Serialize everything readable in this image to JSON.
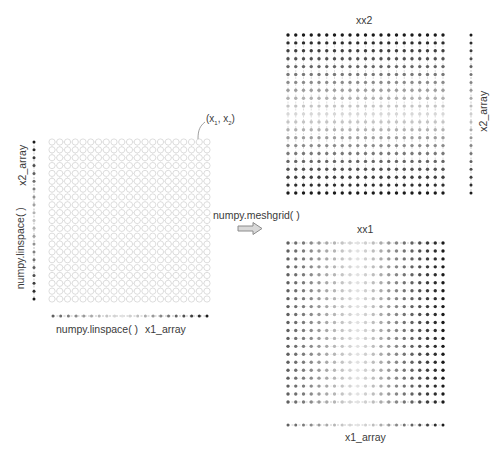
{
  "left_panel": {
    "point_label": "(x₁, x₂)",
    "point_label_main": "(x",
    "x_axis_labels": [
      "numpy.linspace( )",
      "x1_array"
    ],
    "y_axis_labels": [
      "x2_array",
      "numpy.linspace( )"
    ],
    "grid": {
      "cols": 21,
      "rows": 21,
      "x0": 52,
      "y0": 142,
      "x1": 207,
      "y1": 299
    },
    "x_axis": {
      "y": 316,
      "x0": 53,
      "x1": 207,
      "n": 21
    },
    "y_axis": {
      "x": 34,
      "y0": 142,
      "y1": 299,
      "n": 21
    }
  },
  "operation": {
    "label": "numpy.meshgrid( )",
    "arrow_color": "#8c8c8c"
  },
  "xx2_panel": {
    "title": "xx2",
    "side_label": "x2_array",
    "grid": {
      "cols": 21,
      "rows": 21,
      "x0": 288,
      "y0": 35,
      "x1": 443,
      "y1": 193
    },
    "side_axis": {
      "x": 471,
      "y0": 35,
      "y1": 193,
      "n": 21
    }
  },
  "xx1_panel": {
    "title": "xx1",
    "bottom_label": "x1_array",
    "grid": {
      "cols": 21,
      "rows": 21,
      "x0": 288,
      "y0": 243,
      "x1": 443,
      "y1": 402
    },
    "bottom_axis": {
      "y": 425,
      "x0": 288,
      "x1": 443,
      "n": 21
    }
  },
  "colors": {
    "dark_dot": "#1a1a1a",
    "light_dot": "#dddddd",
    "grid_circle": "#cfcfcf",
    "grid_line": "#d6d6d6"
  }
}
